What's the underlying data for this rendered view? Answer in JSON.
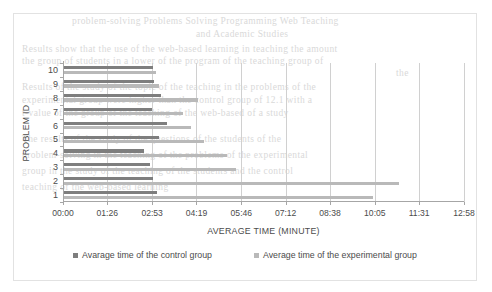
{
  "chart_data": {
    "type": "bar",
    "orientation": "horizontal",
    "title": "",
    "xlabel": "AVERAGE TIME (MINUTE)",
    "ylabel": "PROBLEM ID",
    "grid": true,
    "legend_position": "bottom",
    "x_tick_labels": [
      "00:00",
      "01:26",
      "02:53",
      "04:19",
      "05:46",
      "07:12",
      "08:38",
      "10:05",
      "11:31",
      "12:58"
    ],
    "x_tick_seconds": [
      0,
      86,
      173,
      259,
      346,
      432,
      518,
      605,
      691,
      778
    ],
    "xlim_seconds": [
      0,
      778
    ],
    "categories": [
      "10",
      "9",
      "8",
      "7",
      "6",
      "5",
      "4",
      "3",
      "2",
      "1"
    ],
    "series": [
      {
        "name": "Avarage time of the control group",
        "color": "#7e7e7e",
        "values_label": [
          "02:55",
          "02:56",
          "03:10",
          "02:53",
          "03:22",
          "03:06",
          "02:37",
          "02:49",
          "02:55",
          "03:02"
        ],
        "values_seconds": [
          175,
          176,
          190,
          173,
          202,
          186,
          157,
          169,
          175,
          182
        ]
      },
      {
        "name": "Average time of the experimental group",
        "color": "#b9b9b9",
        "values_label": [
          "03:01",
          "03:06",
          "04:22",
          "03:53",
          "04:08",
          "04:33",
          "05:18",
          "05:35",
          "10:52",
          "10:02"
        ],
        "values_seconds": [
          181,
          186,
          262,
          233,
          248,
          273,
          318,
          335,
          652,
          602
        ]
      }
    ]
  },
  "legend": {
    "items": [
      {
        "label": "Avarage time of the control group",
        "swatch": "#7e7e7e"
      },
      {
        "label": "Average time of the experimental group",
        "swatch": "#b9b9b9"
      }
    ]
  },
  "bleed_text": [
    {
      "text": "problem-solving Problems Solving Programming Web Teaching",
      "x": 72,
      "y": 16
    },
    {
      "text": "and Academic Studies",
      "x": 196,
      "y": 29
    },
    {
      "text": "Results show that the use of the web-based learning in teaching the amount",
      "x": 22,
      "y": 44
    },
    {
      "text": "the group of students in a lower of the program of the teaching group of",
      "x": 22,
      "y": 56
    },
    {
      "text": "the",
      "x": 396,
      "y": 68
    },
    {
      "text": "Results of the study of the topic of the teaching in the problems of the",
      "x": 22,
      "y": 82
    },
    {
      "text": "experimental group were higher than the control group of 12.1 with a",
      "x": 22,
      "y": 95
    },
    {
      "text": "t-value of the group of the teaching of the web-based of a study",
      "x": 22,
      "y": 108
    },
    {
      "text": "The results of the study of the questions of the students of the",
      "x": 22,
      "y": 134
    },
    {
      "text": "problem-solving in the teaching of the problems of the experimental",
      "x": 22,
      "y": 150
    },
    {
      "text": "group in the study of the teaching of the students and the control",
      "x": 22,
      "y": 166
    },
    {
      "text": "teaching of the web-based learning",
      "x": 22,
      "y": 182
    }
  ]
}
